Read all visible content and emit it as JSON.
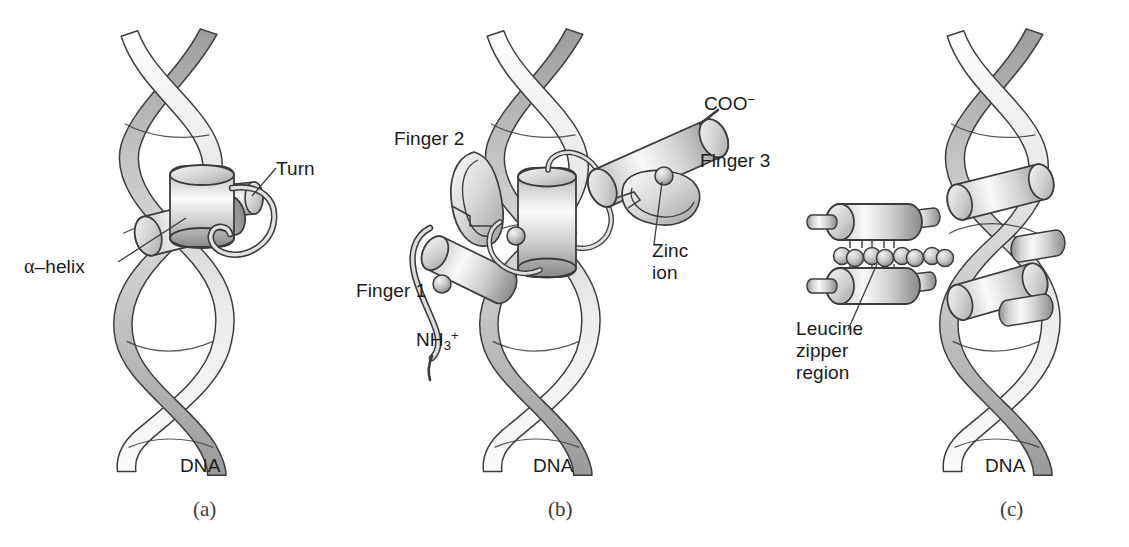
{
  "figure": {
    "background": "#ffffff",
    "ribbon_light": "#fdfdfd",
    "ribbon_mid": "#c8c8c8",
    "ribbon_dark": "#8d8d8d",
    "outline": "#3c3c3c",
    "helix_light": "#f2f2f2",
    "helix_mid": "#b9b9b9",
    "helix_dark": "#7e7e7e",
    "text_color": "#1a1a1a"
  },
  "panels": [
    {
      "id": "a",
      "caption": "(a)",
      "name": "helix-turn-helix",
      "dna_label": "DNA",
      "labels": [
        {
          "key": "alpha_helix",
          "text_prefix": "α",
          "text": "–helix"
        },
        {
          "key": "turn",
          "text": "Turn"
        }
      ]
    },
    {
      "id": "b",
      "caption": "(b)",
      "name": "zinc-finger",
      "dna_label": "DNA",
      "labels": [
        {
          "key": "finger1",
          "text": "Finger 1"
        },
        {
          "key": "finger2",
          "text": "Finger 2"
        },
        {
          "key": "finger3",
          "text": "Finger 3"
        },
        {
          "key": "zinc_ion",
          "text": "Zinc\nion"
        },
        {
          "key": "nh3",
          "text": "NH3+"
        },
        {
          "key": "coo",
          "text": "COO-"
        }
      ]
    },
    {
      "id": "c",
      "caption": "(c)",
      "name": "leucine-zipper",
      "dna_label": "DNA",
      "labels": [
        {
          "key": "leucine_zipper",
          "text": "Leucine\nzipper\nregion"
        }
      ]
    }
  ],
  "labels": {
    "alpha_helix_greek": "α",
    "alpha_helix_rest": "–helix",
    "turn": "Turn",
    "dna_a": "DNA",
    "caption_a": "(a)",
    "finger1": "Finger 1",
    "finger2": "Finger 2",
    "finger3": "Finger 3",
    "zinc_line1": "Zinc",
    "zinc_line2": "ion",
    "nh3_base": "NH",
    "nh3_sub": "3",
    "nh3_sup": "+",
    "coo_base": "COO",
    "coo_sup": "−",
    "dna_b": "DNA",
    "caption_b": "(b)",
    "leucine_line1": "Leucine",
    "leucine_line2": "zipper",
    "leucine_line3": "region",
    "dna_c": "DNA",
    "caption_c": "(c)"
  }
}
